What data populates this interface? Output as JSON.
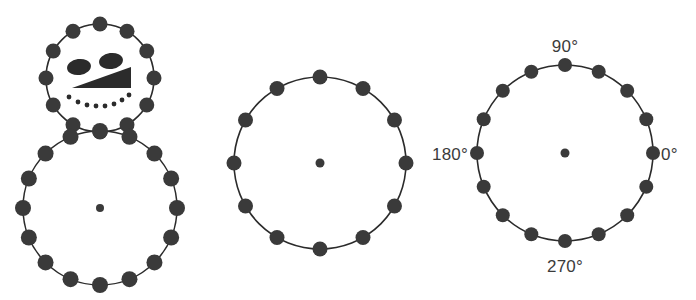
{
  "figure": {
    "background_color": "#ffffff",
    "ink_color": "#2b2b2b",
    "dot_color": "#3a3a3a",
    "panels": [
      {
        "name": "snowman",
        "shapes": [
          {
            "name": "head-circle",
            "cx": 100,
            "cy": 78,
            "r": 54,
            "node_count": 12,
            "node_radius": 7.5,
            "start_angle_deg": 90,
            "has_center_dot": false
          },
          {
            "name": "body-circle",
            "cx": 100,
            "cy": 208,
            "r": 77,
            "node_count": 16,
            "node_radius": 8,
            "start_angle_deg": 90,
            "has_center_dot": true,
            "center_dot_radius": 4
          }
        ],
        "face": {
          "left_eye": {
            "cx": 79,
            "cy": 67,
            "rx": 12,
            "ry": 8,
            "rotation_deg": -8
          },
          "right_eye": {
            "cx": 111,
            "cy": 61,
            "rx": 12,
            "ry": 8,
            "rotation_deg": -8
          },
          "nose": {
            "points": "72,88 131,67 131,88"
          },
          "mouth_dots": [
            {
              "cx": 69,
              "cy": 97,
              "r": 2.4
            },
            {
              "cx": 78,
              "cy": 102,
              "r": 2.4
            },
            {
              "cx": 87,
              "cy": 105,
              "r": 2.4
            },
            {
              "cx": 96,
              "cy": 106,
              "r": 2.4
            },
            {
              "cx": 105,
              "cy": 106,
              "r": 2.4
            },
            {
              "cx": 114,
              "cy": 104,
              "r": 2.4
            },
            {
              "cx": 122,
              "cy": 100,
              "r": 2.4
            },
            {
              "cx": 129,
              "cy": 95,
              "r": 2.4
            }
          ]
        }
      },
      {
        "name": "plain-circle",
        "shapes": [
          {
            "name": "middle-circle",
            "cx": 320,
            "cy": 163,
            "r": 86,
            "node_count": 12,
            "node_radius": 7.5,
            "start_angle_deg": 90,
            "has_center_dot": true,
            "center_dot_radius": 4.5
          }
        ],
        "face": null
      },
      {
        "name": "labeled-circle",
        "shapes": [
          {
            "name": "right-circle",
            "cx": 565,
            "cy": 153,
            "r": 88,
            "node_count": 16,
            "node_radius": 7,
            "start_angle_deg": 90,
            "has_center_dot": true,
            "center_dot_radius": 4.5
          }
        ],
        "face": null
      }
    ],
    "angle_labels": [
      {
        "name": "angle-label-90",
        "text": "90°",
        "x": 565,
        "y": 52,
        "anchor": "middle"
      },
      {
        "name": "angle-label-0",
        "text": "0°",
        "x": 661,
        "y": 160,
        "anchor": "start"
      },
      {
        "name": "angle-label-180",
        "text": "180°",
        "x": 468,
        "y": 160,
        "anchor": "end"
      },
      {
        "name": "angle-label-270",
        "text": "270°",
        "x": 565,
        "y": 272,
        "anchor": "middle"
      }
    ]
  },
  "chart_data": {
    "type": "scatter",
    "title": "",
    "xlabel": "",
    "ylabel": "",
    "grid": false,
    "legend": "none",
    "series": [
      {
        "name": "head-circle-nodes",
        "count": 12,
        "radius": 54,
        "center": [
          100,
          78
        ],
        "angles_deg": [
          90,
          120,
          150,
          180,
          210,
          240,
          270,
          300,
          330,
          0,
          30,
          60
        ]
      },
      {
        "name": "body-circle-nodes",
        "count": 16,
        "radius": 77,
        "center": [
          100,
          208
        ],
        "angles_deg": [
          90,
          112.5,
          135,
          157.5,
          180,
          202.5,
          225,
          247.5,
          270,
          292.5,
          315,
          337.5,
          0,
          22.5,
          45,
          67.5
        ]
      },
      {
        "name": "middle-circle-nodes",
        "count": 12,
        "radius": 86,
        "center": [
          320,
          163
        ],
        "angles_deg": [
          90,
          120,
          150,
          180,
          210,
          240,
          270,
          300,
          330,
          0,
          30,
          60
        ]
      },
      {
        "name": "right-circle-nodes",
        "count": 16,
        "radius": 88,
        "center": [
          565,
          153
        ],
        "angles_deg": [
          90,
          112.5,
          135,
          157.5,
          180,
          202.5,
          225,
          247.5,
          270,
          292.5,
          315,
          337.5,
          0,
          22.5,
          45,
          67.5
        ]
      }
    ],
    "annotations": [
      "90°",
      "0°",
      "180°",
      "270°"
    ],
    "axis_label_angles_deg": [
      90,
      0,
      180,
      270
    ]
  }
}
